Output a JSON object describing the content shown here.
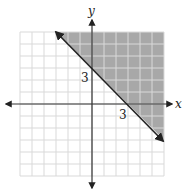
{
  "chart_data": {
    "type": "line",
    "title": "",
    "xlabel": "x",
    "ylabel": "y",
    "xlim": [
      -6,
      6
    ],
    "ylim": [
      -6,
      6
    ],
    "grid": true,
    "grid_step": 1,
    "tick_labels": [
      {
        "axis": "y",
        "value": 3,
        "text": "3"
      },
      {
        "axis": "x",
        "value": 3,
        "text": "3"
      }
    ],
    "boundary_line": {
      "equation": "x + y = 3",
      "style": "solid",
      "arrows": "both",
      "from": [
        -3,
        6
      ],
      "to": [
        6,
        -3
      ]
    },
    "shaded_region": {
      "description": "above/right of boundary line",
      "color": "#a8a8a8"
    },
    "colors": {
      "grid": "#d9d9d9",
      "axes": "#333333",
      "line": "#222222",
      "shade": "#a8a8a8"
    }
  },
  "labels": {
    "x_axis": "x",
    "y_axis": "y",
    "y_tick": "3",
    "x_tick": "3"
  }
}
